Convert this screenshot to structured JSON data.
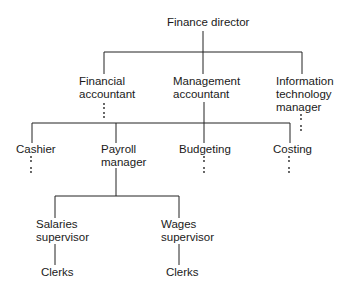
{
  "nodes": {
    "finance_director": {
      "line1": "Finance director"
    },
    "financial_accountant": {
      "line1": "Financial",
      "line2": "accountant"
    },
    "management_accountant": {
      "line1": "Management",
      "line2": "accountant"
    },
    "it_manager": {
      "line1": "Information",
      "line2": "technology",
      "line3": "manager"
    },
    "cashier": {
      "line1": "Cashier"
    },
    "payroll_manager": {
      "line1": "Payroll",
      "line2": "manager"
    },
    "budgeting": {
      "line1": "Budgeting"
    },
    "costing": {
      "line1": "Costing"
    },
    "salaries_supervisor": {
      "line1": "Salaries",
      "line2": "supervisor"
    },
    "wages_supervisor": {
      "line1": "Wages",
      "line2": "supervisor"
    },
    "salaries_clerks": {
      "line1": "Clerks"
    },
    "wages_clerks": {
      "line1": "Clerks"
    }
  },
  "colors": {
    "line": "#222222",
    "text": "#1a1a1a",
    "background": "#ffffff"
  }
}
